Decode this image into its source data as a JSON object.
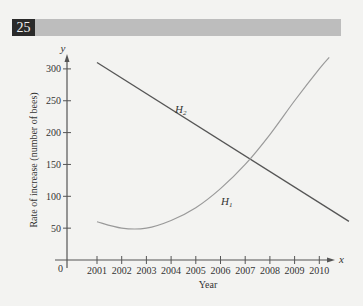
{
  "header": {
    "number": "25"
  },
  "chart_data": {
    "type": "line",
    "title": "",
    "xlabel": "Year",
    "ylabel": "Rate of increase (number of bees)",
    "x_axis_letter": "x",
    "y_axis_letter": "y",
    "origin_label": "0",
    "x_ticks": [
      "2001",
      "2002",
      "2003",
      "2004",
      "2005",
      "2006",
      "2007",
      "2008",
      "2009",
      "2010"
    ],
    "y_ticks": [
      "50",
      "100",
      "150",
      "200",
      "250",
      "300"
    ],
    "ylim": [
      0,
      300
    ],
    "grid": false,
    "x": [
      2001,
      2002,
      2003,
      2004,
      2005,
      2006,
      2007,
      2008,
      2009,
      2010
    ],
    "series": [
      {
        "name": "H1",
        "label_main": "H",
        "label_sub": "1",
        "style": "curve",
        "color": "#9a9a9a",
        "values": [
          60,
          50,
          50,
          62,
          82,
          112,
          150,
          197,
          250,
          300
        ]
      },
      {
        "name": "H2",
        "label_main": "H",
        "label_sub": "2",
        "style": "straight",
        "color": "#555555",
        "values": [
          310,
          286,
          261,
          237,
          212,
          188,
          163,
          139,
          114,
          90
        ]
      }
    ]
  }
}
